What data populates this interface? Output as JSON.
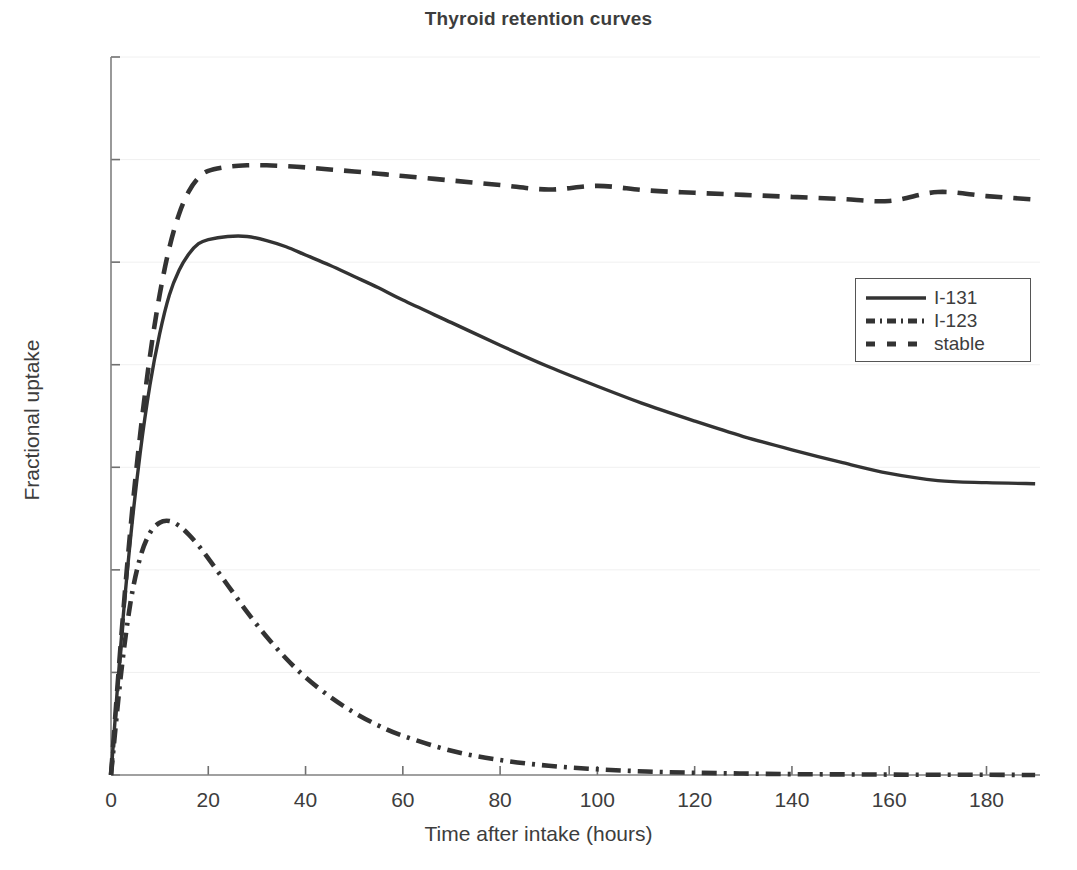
{
  "chart_data": {
    "type": "line",
    "title": "Thyroid retention curves",
    "xlabel": "Time after intake (hours)",
    "ylabel": "Fractional uptake",
    "xlim": [
      0,
      191
    ],
    "ylim": [
      0,
      0.35
    ],
    "xticks": [
      0,
      20,
      40,
      60,
      80,
      100,
      120,
      140,
      160,
      180
    ],
    "yticks": [
      0,
      0.05,
      0.1,
      0.15,
      0.2,
      0.25,
      0.3,
      0.35
    ],
    "xticklabels": [
      "0",
      "20",
      "40",
      "60",
      "80",
      "100",
      "120",
      "140",
      "160",
      "180"
    ],
    "yticklabels": [
      "0",
      "0.05",
      "0.1",
      "0.15",
      "0.2",
      "0.25",
      "0.3",
      "0.35"
    ],
    "grid": true,
    "legend_position": "right-upper",
    "line_color": "#333333",
    "x": [
      0,
      2,
      4,
      6,
      8,
      10,
      12,
      14,
      16,
      18,
      20,
      24,
      28,
      32,
      36,
      40,
      45,
      50,
      55,
      60,
      70,
      80,
      90,
      100,
      110,
      120,
      130,
      140,
      150,
      160,
      170,
      180,
      190
    ],
    "series": [
      {
        "name": "I-131",
        "style": "solid",
        "values": [
          0.0,
          0.063,
          0.115,
          0.157,
          0.19,
          0.215,
          0.234,
          0.246,
          0.254,
          0.259,
          0.261,
          0.2625,
          0.2625,
          0.2605,
          0.2575,
          0.2535,
          0.2485,
          0.243,
          0.2375,
          0.2315,
          0.2205,
          0.2095,
          0.199,
          0.1895,
          0.1805,
          0.1725,
          0.165,
          0.1585,
          0.1525,
          0.147,
          0.1435,
          0.1425,
          0.142
        ]
      },
      {
        "name": "I-123",
        "style": "dashdot",
        "values": [
          0.0,
          0.048,
          0.084,
          0.106,
          0.118,
          0.123,
          0.1238,
          0.1215,
          0.1172,
          0.1118,
          0.1056,
          0.0925,
          0.0794,
          0.0674,
          0.0568,
          0.0476,
          0.0382,
          0.0304,
          0.0241,
          0.0191,
          0.0118,
          0.0073,
          0.0045,
          0.0028,
          0.0017,
          0.0011,
          0.0007,
          0.0004,
          0.0003,
          0.0002,
          0.0001,
          0.0001,
          0.0
        ]
      },
      {
        "name": "stable",
        "style": "dashed",
        "values": [
          0.0,
          0.064,
          0.12,
          0.166,
          0.204,
          0.234,
          0.257,
          0.2735,
          0.2845,
          0.2912,
          0.2945,
          0.2965,
          0.2972,
          0.2972,
          0.2968,
          0.2962,
          0.2952,
          0.2942,
          0.2931,
          0.292,
          0.2898,
          0.2876,
          0.2854,
          0.2872,
          0.285,
          0.2838,
          0.2828,
          0.2818,
          0.2808,
          0.2798,
          0.2842,
          0.2822,
          0.2805
        ]
      }
    ]
  },
  "legend": {
    "entries": [
      {
        "label": "I-131",
        "style": "solid"
      },
      {
        "label": "I-123",
        "style": "dashdot"
      },
      {
        "label": "stable",
        "style": "dashed"
      }
    ]
  }
}
